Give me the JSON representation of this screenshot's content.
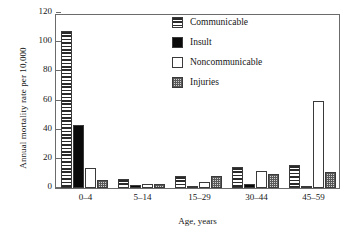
{
  "chart_data": {
    "type": "bar",
    "title": "",
    "xlabel": "Age, years",
    "ylabel": "Annual mortality rate per 10,000",
    "categories": [
      "0–4",
      "5–14",
      "15–29",
      "30–44",
      "45–59"
    ],
    "ylim": [
      0,
      120
    ],
    "yticks": [
      0,
      20,
      40,
      60,
      80,
      100,
      120
    ],
    "ytick_labels": [
      "0",
      "20",
      "40",
      "60",
      "80",
      "100",
      "120"
    ],
    "grid": false,
    "legend_position": "top-right",
    "series": [
      {
        "name": "Communicable",
        "pattern": "horizontal-stripes",
        "fill": "#ffffff",
        "stroke": "#3a3a3a",
        "values": [
          107.5,
          6.5,
          8.0,
          14.5,
          15.5
        ]
      },
      {
        "name": "Insult",
        "pattern": "solid",
        "fill": "#0a0a0a",
        "stroke": "#3a3a3a",
        "values": [
          43.0,
          2.0,
          1.5,
          2.5,
          1.0
        ]
      },
      {
        "name": "Noncommunicable",
        "pattern": "empty",
        "fill": "#ffffff",
        "stroke": "#3a3a3a",
        "values": [
          14.0,
          2.5,
          4.0,
          12.0,
          60.0
        ]
      },
      {
        "name": "Injuries",
        "pattern": "stippled",
        "fill": "#d2d2d2",
        "stroke": "#3a3a3a",
        "values": [
          5.5,
          3.0,
          8.0,
          9.5,
          11.0
        ]
      }
    ]
  },
  "axis": {
    "frame_color": "#6b6b6b"
  }
}
